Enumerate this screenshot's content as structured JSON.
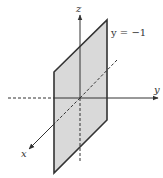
{
  "diagram": {
    "title": "",
    "plane_label": "y = −1",
    "axes": {
      "x": "x",
      "y": "y",
      "z": "z"
    },
    "colors": {
      "plane_fill": "#d9d9d9",
      "plane_edge": "#333333",
      "axis": "#333333"
    }
  }
}
